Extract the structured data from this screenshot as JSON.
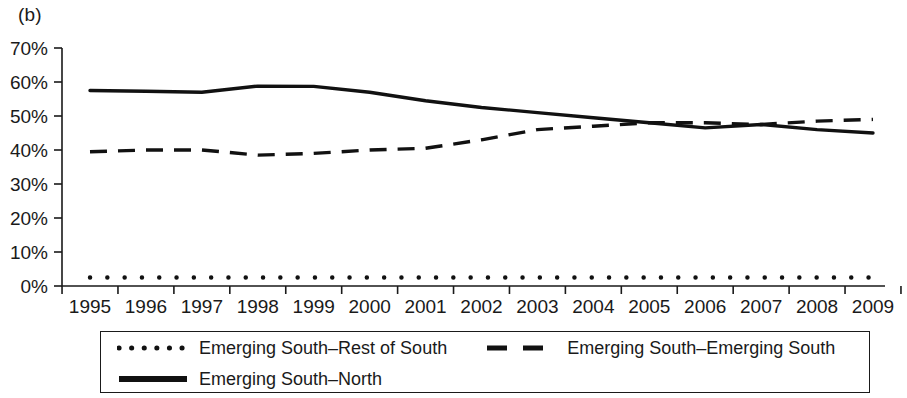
{
  "figure": {
    "panel_label": "(b)"
  },
  "axes": {
    "y_ticks": [
      "0%",
      "10%",
      "20%",
      "30%",
      "40%",
      "50%",
      "60%",
      "70%"
    ],
    "y_min": 0,
    "y_max": 70,
    "x_ticks": [
      "1995",
      "1996",
      "1997",
      "1998",
      "1999",
      "2000",
      "2001",
      "2002",
      "2003",
      "2004",
      "2005",
      "2006",
      "2007",
      "2008",
      "2009"
    ]
  },
  "legend": {
    "items": [
      {
        "key": "dotted",
        "label": "Emerging South–Rest of South"
      },
      {
        "key": "dashed",
        "label": "Emerging South–Emerging South"
      },
      {
        "key": "solid",
        "label": "Emerging South–North"
      }
    ]
  },
  "colors": {
    "line": "#111111",
    "axis": "#1a1a1a",
    "background": "#ffffff"
  },
  "chart_data": {
    "type": "line",
    "title": "(b)",
    "xlabel": "",
    "ylabel": "",
    "x": [
      1995,
      1996,
      1997,
      1998,
      1999,
      2000,
      2001,
      2002,
      2003,
      2004,
      2005,
      2006,
      2007,
      2008,
      2009
    ],
    "xtick_labels": [
      "1995",
      "1996",
      "1997",
      "1998",
      "1999",
      "2000",
      "2001",
      "2002",
      "2003",
      "2004",
      "2005",
      "2006",
      "2007",
      "2008",
      "2009"
    ],
    "ytick_labels": [
      "0%",
      "10%",
      "20%",
      "30%",
      "40%",
      "50%",
      "60%",
      "70%"
    ],
    "ylim": [
      0,
      70
    ],
    "xlim": [
      1995,
      2009
    ],
    "grid": false,
    "legend_position": "below",
    "units": "percent",
    "series": [
      {
        "name": "Emerging South–North",
        "style": "solid",
        "values": [
          57.5,
          57.3,
          57.0,
          58.8,
          58.7,
          57.0,
          54.5,
          52.5,
          51.0,
          49.5,
          48.0,
          46.5,
          47.5,
          46.0,
          45.0
        ]
      },
      {
        "name": "Emerging South–Emerging South",
        "style": "dashed",
        "values": [
          39.5,
          40.0,
          40.0,
          38.5,
          39.0,
          40.0,
          40.5,
          43.0,
          46.0,
          47.0,
          48.0,
          48.0,
          47.5,
          48.5,
          49.0
        ]
      },
      {
        "name": "Emerging South–Rest of South",
        "style": "dotted",
        "values": [
          2.5,
          2.5,
          2.5,
          2.5,
          2.5,
          2.5,
          2.5,
          2.5,
          2.5,
          2.5,
          2.5,
          2.5,
          2.5,
          2.5,
          2.5
        ]
      }
    ]
  }
}
